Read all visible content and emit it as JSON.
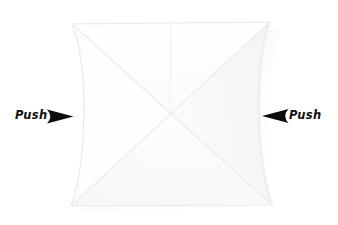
{
  "canvas": {
    "width": 338,
    "height": 225,
    "background_color": "#ffffff"
  },
  "diagram": {
    "kind": "origami-instruction-step",
    "paper": {
      "fill_color": "#fdfdfd",
      "edge_color": "#e9e9e9",
      "crease_color": "#ededed",
      "shadow_color": "#e3e3e3",
      "description": "square sheet with diagonal X creases and pinched concave left and right edges"
    },
    "arrows": {
      "color": "#0d0d0d",
      "left_direction": "right",
      "right_direction": "left"
    }
  },
  "annotations": {
    "left": {
      "label": "Push",
      "arrow_icon": "arrow-right-solid"
    },
    "right": {
      "label": "Push",
      "arrow_icon": "arrow-left-solid"
    }
  }
}
